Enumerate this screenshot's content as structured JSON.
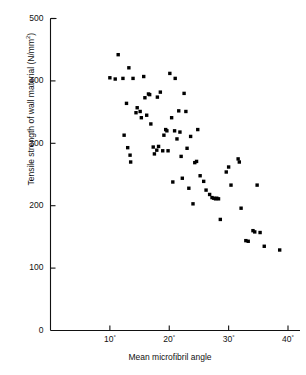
{
  "figure": {
    "background": "#ffffff",
    "ink_color": "#000000"
  },
  "axes": {
    "y_title": "Tensile strength of wall material (N/mm²)",
    "y_title_main": "Tensile strength of wall material (N/mm",
    "y_title_sup": "2",
    "y_title_close": ")",
    "x_title": "Mean microfibril angle",
    "y_ticks": [
      "0",
      "100",
      "200",
      "300",
      "400",
      "500"
    ],
    "y_tick_values": [
      0,
      100,
      200,
      300,
      400,
      500
    ],
    "x_ticks": [
      "10",
      "20",
      "30",
      "40"
    ],
    "x_tick_values": [
      10,
      20,
      30,
      40
    ],
    "x_tick_suffix": "°"
  },
  "chart_data": {
    "type": "scatter",
    "title": "",
    "xlabel": "Mean microfibril angle",
    "ylabel": "Tensile strength of wall material (N/mm2)",
    "xlim": [
      0,
      40
    ],
    "ylim": [
      0,
      500
    ],
    "xticks": [
      10,
      20,
      30,
      40
    ],
    "yticks": [
      0,
      100,
      200,
      300,
      400,
      500
    ],
    "grid": false,
    "legend": "none",
    "marker": "square",
    "marker_color": "#000000",
    "n_points": 75,
    "points": [
      [
        10.0,
        405
      ],
      [
        10.9,
        403
      ],
      [
        11.4,
        442
      ],
      [
        12.2,
        404
      ],
      [
        12.4,
        313
      ],
      [
        12.8,
        364
      ],
      [
        13.0,
        293
      ],
      [
        13.2,
        421
      ],
      [
        13.4,
        281
      ],
      [
        13.5,
        270
      ],
      [
        13.9,
        404
      ],
      [
        14.4,
        349
      ],
      [
        14.6,
        357
      ],
      [
        15.1,
        351
      ],
      [
        15.3,
        341
      ],
      [
        15.7,
        407
      ],
      [
        15.9,
        373
      ],
      [
        16.2,
        345
      ],
      [
        16.5,
        379
      ],
      [
        16.7,
        378
      ],
      [
        16.9,
        331
      ],
      [
        17.3,
        294
      ],
      [
        17.5,
        283
      ],
      [
        17.9,
        289
      ],
      [
        18.2,
        295
      ],
      [
        18.5,
        382
      ],
      [
        18.9,
        288
      ],
      [
        19.1,
        313
      ],
      [
        19.4,
        322
      ],
      [
        19.6,
        320
      ],
      [
        19.8,
        288
      ],
      [
        20.1,
        412
      ],
      [
        20.4,
        341
      ],
      [
        20.6,
        238
      ],
      [
        21.0,
        404
      ],
      [
        21.3,
        307
      ],
      [
        21.6,
        352
      ],
      [
        21.8,
        318
      ],
      [
        22.0,
        279
      ],
      [
        22.2,
        244
      ],
      [
        22.5,
        380
      ],
      [
        22.8,
        351
      ],
      [
        23.0,
        292
      ],
      [
        23.3,
        228
      ],
      [
        23.6,
        311
      ],
      [
        24.0,
        203
      ],
      [
        24.3,
        269
      ],
      [
        24.8,
        322
      ],
      [
        25.2,
        248
      ],
      [
        25.8,
        239
      ],
      [
        26.2,
        225
      ],
      [
        26.8,
        218
      ],
      [
        27.2,
        213
      ],
      [
        27.5,
        212
      ],
      [
        27.8,
        211
      ],
      [
        28.0,
        212
      ],
      [
        28.3,
        211
      ],
      [
        28.6,
        178
      ],
      [
        29.6,
        254
      ],
      [
        30.0,
        262
      ],
      [
        30.4,
        233
      ],
      [
        31.6,
        275
      ],
      [
        31.8,
        270
      ],
      [
        32.1,
        196
      ],
      [
        32.9,
        144
      ],
      [
        33.3,
        143
      ],
      [
        34.1,
        160
      ],
      [
        34.4,
        158
      ],
      [
        34.8,
        233
      ],
      [
        35.3,
        157
      ],
      [
        36.0,
        135
      ],
      [
        38.6,
        129
      ],
      [
        18.0,
        374
      ],
      [
        20.9,
        320
      ],
      [
        24.6,
        271
      ]
    ]
  }
}
